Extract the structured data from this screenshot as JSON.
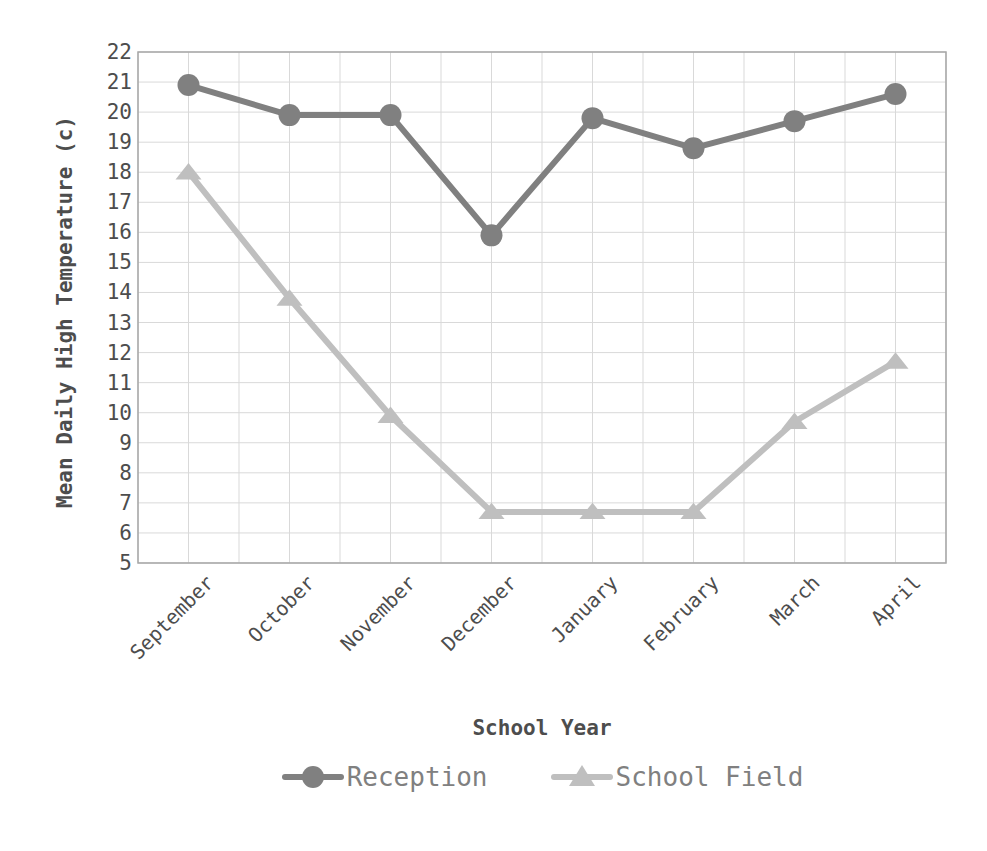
{
  "chart_data": {
    "type": "line",
    "title": "",
    "xlabel": "School Year",
    "ylabel": "Mean Daily High Temperature (c)",
    "categories": [
      "September",
      "October",
      "November",
      "December",
      "January",
      "February",
      "March",
      "April"
    ],
    "series": [
      {
        "name": "Reception",
        "color": "#808080",
        "marker": "circle",
        "values": [
          20.9,
          19.9,
          19.9,
          15.9,
          19.8,
          18.8,
          19.7,
          20.6
        ]
      },
      {
        "name": "School Field",
        "color": "#bfbfbf",
        "marker": "triangle",
        "values": [
          18.0,
          13.8,
          9.9,
          6.7,
          6.7,
          6.7,
          9.7,
          11.7
        ]
      }
    ],
    "ylim": [
      5,
      22
    ],
    "yticks": [
      5,
      6,
      7,
      8,
      9,
      10,
      11,
      12,
      13,
      14,
      15,
      16,
      17,
      18,
      19,
      20,
      21,
      22
    ],
    "ytick_labels": [
      "5",
      "6",
      "7",
      "8",
      "9",
      "10",
      "11",
      "12",
      "13",
      "14",
      "15",
      "16",
      "17",
      "18",
      "19",
      "20",
      "21",
      "22"
    ],
    "grid": "both",
    "legend_position": "bottom",
    "colors": {
      "reception": "#808080",
      "school_field": "#bfbfbf",
      "grid": "#d9d9d9",
      "axis": "#a6a6a6",
      "text": "#4d4d4d"
    }
  },
  "legend": {
    "entries": [
      {
        "label": "Reception",
        "marker": "circle-marker",
        "color": "#808080"
      },
      {
        "label": "School Field",
        "marker": "triangle-marker",
        "color": "#bfbfbf"
      }
    ]
  }
}
